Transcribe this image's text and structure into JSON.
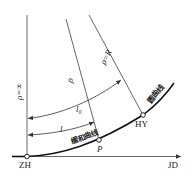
{
  "diagram": {
    "type": "transition-curve-schematic",
    "colors": {
      "line": "#555555",
      "curve": "#111111",
      "text": "#222222",
      "background": "#ffffff"
    },
    "axes": {
      "vertical_label": "ρ=∞",
      "horizontal_end_label": "JD"
    },
    "points": [
      {
        "id": "ZH",
        "label": "ZH",
        "x": 27,
        "y": 156
      },
      {
        "id": "P",
        "label": "P",
        "x": 99,
        "y": 140
      },
      {
        "id": "HY",
        "label": "HY",
        "x": 143,
        "y": 115
      }
    ],
    "curves": [
      {
        "id": "transition",
        "label": "缓和曲线"
      },
      {
        "id": "circular",
        "label": "圆曲线"
      }
    ],
    "radius_lines": [
      {
        "id": "rho",
        "label": "ρ"
      },
      {
        "id": "rho-R",
        "label": "ρ=R"
      }
    ],
    "dimensions": [
      {
        "id": "l",
        "label": "l"
      },
      {
        "id": "l0",
        "label": "l₀"
      }
    ]
  }
}
